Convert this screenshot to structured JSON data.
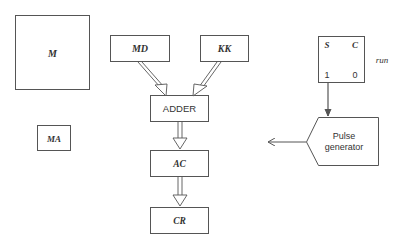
{
  "diagram": {
    "blocks": {
      "memory": {
        "label": "M"
      },
      "memory_data": {
        "label": "MD"
      },
      "constant": {
        "label": "KK"
      },
      "adder": {
        "label": "ADDER"
      },
      "memory_address": {
        "label": "MA"
      },
      "accumulator": {
        "label": "AC"
      },
      "control_register": {
        "label": "CR"
      },
      "run_flipflop": {
        "set_label": "S",
        "clear_label": "C",
        "set_value": "1",
        "clear_value": "0",
        "name_label": "run"
      },
      "pulse_generator": {
        "line1": "Pulse",
        "line2": "generator"
      }
    },
    "connections": [
      {
        "from": "MD",
        "to": "ADDER",
        "style": "double-line arrow"
      },
      {
        "from": "KK",
        "to": "ADDER",
        "style": "double-line arrow"
      },
      {
        "from": "ADDER",
        "to": "AC",
        "style": "double-line arrow"
      },
      {
        "from": "AC",
        "to": "CR",
        "style": "double-line arrow"
      },
      {
        "from": "run",
        "to": "Pulse generator",
        "style": "single arrow"
      },
      {
        "from": "Pulse generator",
        "to": "left (output)",
        "style": "single arrow"
      }
    ],
    "colors": {
      "line": "#555555",
      "text": "#333333",
      "background": "#ffffff"
    }
  }
}
